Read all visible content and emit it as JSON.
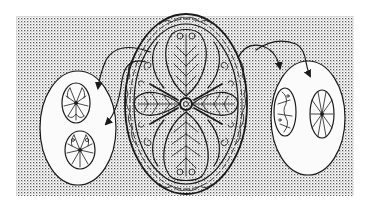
{
  "illustration": {
    "title": "",
    "description": "Line drawing of an oval ornamental brooch with a four-petal butterfly/leaf motif, flanked by two oval callouts with arrows showing smaller egg-shaped ornaments",
    "background": {
      "pattern": "halftone-dots",
      "color": "#ffffff",
      "dot_color": "#555555",
      "bounds": {
        "x": 16,
        "y": 16,
        "width": 338,
        "height": 180
      }
    },
    "center_brooch": {
      "label": "",
      "cx": 186,
      "cy": 104,
      "rx": 60,
      "ry": 90,
      "motif": "four leaf-shaped petals with vein lines around a central ring"
    },
    "left_callout": {
      "label": "",
      "cx": 78,
      "cy": 128,
      "rx": 38,
      "ry": 57,
      "items": [
        {
          "name": "upper-egg-ornament",
          "cx": 76,
          "cy": 103,
          "rx": 14,
          "ry": 20
        },
        {
          "name": "lower-egg-ornament",
          "cx": 80,
          "cy": 150,
          "rx": 15,
          "ry": 19
        }
      ],
      "arrows": 2
    },
    "right_callout": {
      "label": "",
      "cx": 308,
      "cy": 118,
      "rx": 37,
      "ry": 57,
      "items": [
        {
          "name": "left-egg-ornament",
          "cx": 285,
          "cy": 112,
          "rx": 11,
          "ry": 24
        },
        {
          "name": "right-egg-ornament",
          "cx": 322,
          "cy": 114,
          "rx": 12,
          "ry": 24
        }
      ],
      "arrows": 2
    },
    "line_color": "#1a1a1a",
    "callout_fill": "#fbfbfb"
  }
}
